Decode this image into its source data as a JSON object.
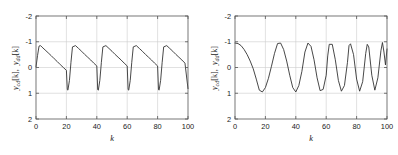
{
  "figure": {
    "background": "#ffffff",
    "line_color": "#333333",
    "grid_color": "#cccccc",
    "axis_color": "#555555",
    "text_color": "#1a1a1a"
  },
  "panels": [
    {
      "id": "left",
      "name": "sawtooth-response-plot",
      "ylabel_parts": [
        "y",
        "cd",
        "[k],",
        "y",
        "dd",
        "[k]"
      ],
      "ylabel": "y_cd[k],  y_dd[k]",
      "xlabel": "k",
      "xticks": [
        "0",
        "20",
        "40",
        "60",
        "80",
        "100"
      ],
      "yticks": [
        "2",
        "1",
        "0",
        "-1",
        "-2"
      ]
    },
    {
      "id": "right",
      "name": "chirp-response-plot",
      "ylabel_parts": [
        "y",
        "cd",
        "[k],",
        "y",
        "dd",
        "[k]"
      ],
      "ylabel": "y_cd[k],  y_dd[k]",
      "xlabel": "k",
      "xticks": [
        "0",
        "20",
        "40",
        "60",
        "80",
        "100"
      ],
      "yticks": [
        "2",
        "1",
        "0",
        "-1",
        "-2"
      ]
    }
  ],
  "chart_data": [
    {
      "type": "line",
      "title": "",
      "panel": "left",
      "xlabel": "k",
      "ylabel": "y_cd[k],  y_dd[k]",
      "xlim": [
        0,
        100
      ],
      "ylim": [
        -2,
        2
      ],
      "xticks": [
        0,
        20,
        40,
        60,
        80,
        100
      ],
      "yticks": [
        -2,
        -1,
        0,
        1,
        2
      ],
      "grid": true,
      "legend": null,
      "description": "Sawtooth-like periodic response, period 20 samples, rising edge from 0 to 0.85 over ~3 samples then linear decay to -0.88 before snapping back up.",
      "series": [
        {
          "name": "y_cd[k], y_dd[k]",
          "color": "#333333",
          "x": [
            0,
            1,
            2,
            3,
            4,
            6,
            8,
            10,
            12,
            14,
            16,
            18,
            20,
            20.6,
            21,
            22,
            23,
            24,
            26,
            28,
            30,
            32,
            34,
            36,
            38,
            40,
            40.6,
            41,
            42,
            43,
            44,
            46,
            48,
            50,
            52,
            54,
            56,
            58,
            60,
            60.6,
            61,
            62,
            63,
            64,
            66,
            68,
            70,
            72,
            74,
            76,
            78,
            80,
            80.6,
            81,
            82,
            83,
            84,
            86,
            88,
            90,
            92,
            94,
            96,
            98,
            100
          ],
          "y": [
            0.02,
            0.46,
            0.83,
            0.85,
            0.79,
            0.68,
            0.57,
            0.46,
            0.34,
            0.23,
            0.11,
            0.0,
            -0.11,
            -0.86,
            -0.88,
            -0.5,
            0.2,
            0.8,
            0.85,
            0.74,
            0.63,
            0.51,
            0.4,
            0.29,
            0.17,
            0.06,
            -0.86,
            -0.88,
            -0.5,
            0.2,
            0.8,
            0.85,
            0.74,
            0.63,
            0.51,
            0.4,
            0.29,
            0.17,
            0.06,
            -0.86,
            -0.88,
            -0.5,
            0.2,
            0.8,
            0.85,
            0.74,
            0.63,
            0.51,
            0.4,
            0.29,
            0.17,
            0.06,
            -0.86,
            -0.88,
            -0.5,
            0.2,
            0.8,
            0.85,
            0.74,
            0.63,
            0.51,
            0.4,
            0.29,
            0.17,
            -0.82
          ]
        }
      ]
    },
    {
      "type": "line",
      "title": "",
      "panel": "right",
      "xlabel": "k",
      "ylabel": "y_cd[k],  y_dd[k]",
      "xlim": [
        0,
        100
      ],
      "ylim": [
        -2,
        2
      ],
      "xticks": [
        0,
        20,
        40,
        60,
        80,
        100
      ],
      "yticks": [
        -2,
        -1,
        0,
        1,
        2
      ],
      "grid": true,
      "legend": null,
      "description": "Chirp-like oscillation of amplitude ~0.95 whose frequency increases with k; first trough near k=16, peaks near k=28, 46, 61, 74, 86, 97.",
      "series": [
        {
          "name": "y_cd[k], y_dd[k]",
          "color": "#333333",
          "x": [
            0,
            2,
            4,
            6,
            8,
            10,
            12,
            14,
            16,
            18,
            20,
            22,
            24,
            26,
            28,
            30,
            32,
            34,
            36,
            38,
            40,
            42,
            44,
            46,
            48,
            50,
            52,
            54,
            56,
            58,
            60,
            61,
            62,
            64,
            66,
            68,
            70,
            72,
            74,
            75,
            76,
            78,
            80,
            82,
            84,
            86,
            87,
            88,
            90,
            92,
            94,
            96,
            97,
            98,
            99,
            100
          ],
          "y": [
            0.95,
            0.93,
            0.85,
            0.7,
            0.5,
            0.25,
            -0.05,
            -0.45,
            -0.88,
            -0.95,
            -0.78,
            -0.42,
            0.05,
            0.55,
            0.93,
            0.95,
            0.7,
            0.25,
            -0.3,
            -0.78,
            -0.95,
            -0.7,
            -0.15,
            0.6,
            0.95,
            0.82,
            0.3,
            -0.4,
            -0.9,
            -0.85,
            -0.3,
            0.45,
            0.9,
            0.9,
            0.3,
            -0.5,
            -0.92,
            -0.7,
            0.2,
            0.85,
            0.92,
            0.5,
            -0.45,
            -0.92,
            -0.55,
            0.55,
            0.9,
            0.8,
            -0.3,
            -0.88,
            -0.4,
            0.65,
            0.97,
            0.6,
            0.1,
            0.72
          ]
        }
      ]
    }
  ]
}
